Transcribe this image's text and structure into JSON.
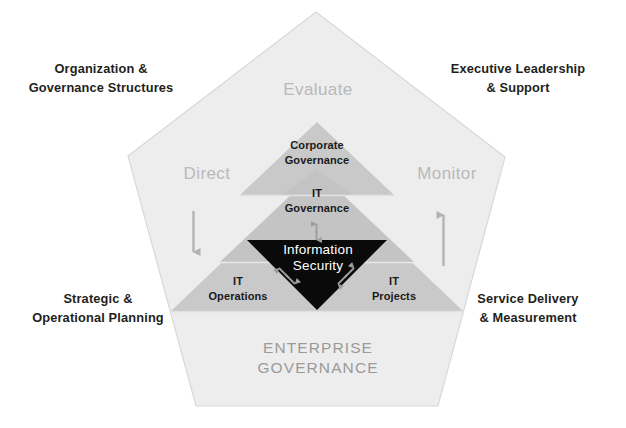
{
  "diagram": {
    "title": "Enterprise Governance",
    "footer_label": "ENTERPRISE\nGOVERNANCE",
    "corners": {
      "top_left": "Organization &\nGovernance Structures",
      "top_right": "Executive Leadership\n& Support",
      "bottom_left": "Strategic &\nOperational Planning",
      "bottom_right": "Service Delivery\n& Measurement"
    },
    "edm": {
      "evaluate": "Evaluate",
      "direct": "Direct",
      "monitor": "Monitor"
    },
    "layers": {
      "corporate_governance": "Corporate\nGovernance",
      "it_governance": "IT\nGovernance",
      "information_security": "Information\nSecurity",
      "it_operations": "IT\nOperations",
      "it_projects": "IT\nProjects"
    },
    "colors": {
      "pentagon_fill": "#ededed",
      "pentagon_stroke": "#d6d6d6",
      "triangle_fill": "#c9c9c9",
      "triangle_overlap": "#bdbdbd",
      "information_security_fill": "#0a0a0a",
      "arrow_gray": "#b3b3b3",
      "edm_text": "#b9b9b9",
      "footer_text": "#9a9a9a",
      "corner_text": "#231f20",
      "page_background": "#ffffff"
    }
  }
}
